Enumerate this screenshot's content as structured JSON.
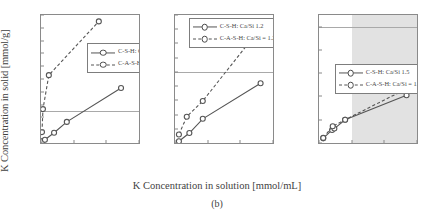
{
  "figure": {
    "caption": "(b)",
    "xlabel": "K Concentration in solution [mmol/mL]",
    "ylabel": "K Concentration in solid [mmol/g]"
  },
  "chart_data": [
    {
      "type": "line",
      "panel": "left",
      "title": "",
      "xlabel": "K Concentration in solution [mmol/mL]",
      "ylabel": "K Concentration in solid [mmol/g]",
      "xlim": [
        0,
        0.3
      ],
      "ylim": [
        0,
        2
      ],
      "xticks": [
        0,
        0.1,
        0.2,
        0.3
      ],
      "xticklabels": [
        "0",
        "0.1",
        "0.2",
        "0.3"
      ],
      "yticks": [
        0,
        0.2,
        0.4,
        0.6,
        0.8,
        1,
        1.2,
        1.4,
        1.6,
        1.8,
        2
      ],
      "yticklabels": [
        "0",
        "0.2",
        "0.4",
        "0.6",
        "0.8",
        "1",
        "1.2",
        "1.4",
        "1.6",
        "1.8",
        "2"
      ],
      "grid": false,
      "reference_line_y": 0.5,
      "legend_position": "center-right",
      "series": [
        {
          "name": "C-S-H: Ca/Si 0.85",
          "style": "solid",
          "marker": "open-circle",
          "x": [
            0.005,
            0.012,
            0.04,
            0.079,
            0.245
          ],
          "y": [
            0.03,
            0.05,
            0.16,
            0.33,
            0.86
          ]
        },
        {
          "name": "C-A-S-H: Ca/Si = 0.85",
          "style": "dashed",
          "marker": "open-circle",
          "x": [
            0.003,
            0.006,
            0.024,
            0.177
          ],
          "y": [
            0.17,
            0.53,
            1.06,
            1.9
          ]
        }
      ]
    },
    {
      "type": "line",
      "panel": "middle",
      "title": "",
      "xlabel": "K Concentration in solution [mmol/mL]",
      "ylabel": "",
      "xlim": [
        0,
        0.3
      ],
      "ylim": [
        0,
        0.9
      ],
      "xticks": [
        0,
        0.1,
        0.2,
        0.3
      ],
      "xticklabels": [
        "0",
        "0.1",
        "0.2",
        "0.3"
      ],
      "yticks": [
        0,
        0.1,
        0.2,
        0.3,
        0.4,
        0.5,
        0.6,
        0.7,
        0.8,
        0.9
      ],
      "yticklabels": [
        "0",
        "0.1",
        "0.2",
        "0.3",
        "0.4",
        "0.5",
        "0.6",
        "0.7",
        "0.8",
        "0.9"
      ],
      "grid": false,
      "reference_line_y": 0.5,
      "legend_position": "upper-left",
      "series": [
        {
          "name": "C-S-H: Ca/Si 1.2",
          "style": "solid",
          "marker": "open-circle",
          "x": [
            0.012,
            0.044,
            0.085,
            0.262
          ],
          "y": [
            0.012,
            0.07,
            0.17,
            0.42
          ]
        },
        {
          "name": "C-A-S-H: Ca/Si = 1.2",
          "style": "dashed",
          "marker": "open-circle",
          "x": [
            0.012,
            0.036,
            0.085,
            0.25
          ],
          "y": [
            0.06,
            0.185,
            0.295,
            0.775
          ]
        }
      ]
    },
    {
      "type": "line",
      "panel": "right",
      "title": "",
      "xlabel": "K Concentration in solution [mmol/mL]",
      "ylabel": "",
      "xlim": [
        0,
        0.3
      ],
      "ylim": [
        0,
        0.55
      ],
      "xticks": [
        0,
        0.1,
        0.2,
        0.3
      ],
      "xticklabels": [
        "0",
        "0.1",
        "0.2",
        "0.3"
      ],
      "yticks": [
        0,
        0.1,
        0.2,
        0.3,
        0.4,
        0.5
      ],
      "yticklabels": [
        "0",
        "0.1",
        "0.2",
        "0.3",
        "0.4",
        "0.5"
      ],
      "grid": false,
      "reference_line_y": 0.5,
      "shaded_region_x": [
        0.1,
        0.3
      ],
      "shaded_region_color": "#e2e2e2",
      "legend_position": "center-left",
      "series": [
        {
          "name": "C-S-H: Ca/Si 1.5",
          "style": "solid",
          "marker": "open-circle",
          "x": [
            0.013,
            0.04,
            0.047,
            0.08,
            0.268
          ],
          "y": [
            0.02,
            0.056,
            0.062,
            0.1,
            0.205
          ]
        },
        {
          "name": "C-A-S-H: Ca/Si = 1.5",
          "style": "dashed",
          "marker": "open-circle",
          "x": [
            0.013,
            0.042,
            0.08,
            0.268
          ],
          "y": [
            0.022,
            0.072,
            0.1,
            0.233
          ]
        }
      ]
    }
  ],
  "colors": {
    "line": "#555555",
    "axis": "#8a8a8a",
    "text": "#3f3f3f",
    "shade": "#e2e2e2",
    "refline": "#a9a9a9"
  }
}
